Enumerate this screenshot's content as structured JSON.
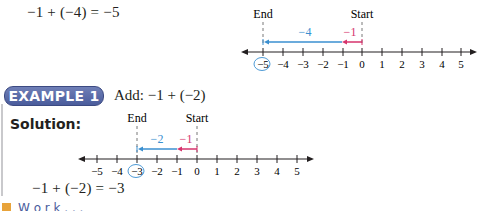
{
  "top": {
    "equation": "−1 + (−4) = −5",
    "number_line": {
      "end_label": "End",
      "start_label": "Start",
      "ticks": [
        "−5",
        "−4",
        "−3",
        "−2",
        "−1",
        "0",
        "1",
        "2",
        "3",
        "4",
        "5"
      ],
      "circled_tick": "−5",
      "step1_label": "−1",
      "step2_label": "−4"
    }
  },
  "example": {
    "badge": "EXAMPLE 1",
    "prompt": "Add:   −1 + (−2)",
    "solution_label": "Solution:",
    "number_line": {
      "end_label": "End",
      "start_label": "Start",
      "ticks": [
        "−5",
        "−4",
        "−3",
        "−2",
        "−1",
        "0",
        "1",
        "2",
        "3",
        "4",
        "5"
      ],
      "circled_tick": "−3",
      "step1_label": "−1",
      "step2_label": "−2"
    },
    "equation": "−1 + (−2) = −3"
  },
  "footer": {
    "icon": "orange-square-icon",
    "text": "W o r k . . ."
  },
  "colors": {
    "blue": "#3a8fd0",
    "pink": "#d6336c",
    "badge": "#5465a4",
    "icon": "#e8a33a"
  }
}
